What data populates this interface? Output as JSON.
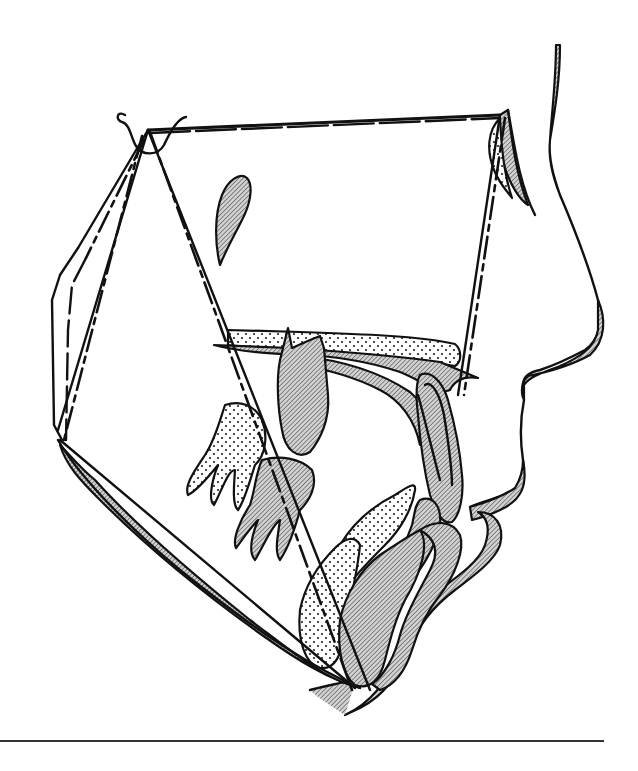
{
  "figure": {
    "type": "cephalometric superimposition tracing",
    "colors": {
      "line": "#111111",
      "hatch_fill": "#9a9a9a",
      "dot_fill": "#222222",
      "background": "#ffffff"
    },
    "legend": [],
    "caption": ""
  },
  "footer": {
    "divider": true
  }
}
